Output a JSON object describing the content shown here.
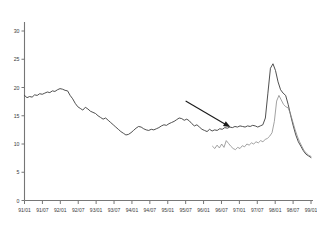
{
  "chart_data": {
    "type": "line",
    "title": "",
    "subtitle": "",
    "xlabel": "",
    "ylabel": "",
    "grid": false,
    "legend": "none",
    "ylim": [
      0,
      30
    ],
    "yticks": [
      0,
      5,
      10,
      15,
      20,
      25,
      30
    ],
    "ytick_labels": [
      "0",
      "5",
      "10",
      "15",
      "20",
      "25",
      "30"
    ],
    "xtick_labels": [
      "91/01",
      "91/07",
      "92/01",
      "92/07",
      "93/01",
      "93/07",
      "94/01",
      "94/07",
      "95/01",
      "95/07",
      "96/01",
      "96/07",
      "97/01",
      "97/07",
      "98/01",
      "98/07",
      "99/01"
    ],
    "xlim_labels": [
      "91/01",
      "99/01"
    ],
    "annotations": [
      {
        "name": "down-right-arrow",
        "type": "arrow",
        "x1_label": "95/07",
        "y1_value": 17.6,
        "x2_label": "96/10",
        "y2_value": 13.0
      }
    ],
    "series": [
      {
        "name": "upper-series",
        "color": "#3c3c3c",
        "width": 0.9,
        "x_start_label": "91/01",
        "values": [
          18.6,
          18.2,
          18.4,
          18.3,
          18.7,
          18.6,
          18.9,
          18.8,
          19.0,
          19.2,
          19.1,
          19.4,
          19.3,
          19.6,
          19.8,
          19.7,
          19.5,
          19.4,
          18.6,
          18.0,
          17.2,
          16.6,
          16.3,
          16.0,
          16.5,
          16.2,
          15.8,
          15.6,
          15.4,
          15.0,
          14.7,
          14.4,
          14.6,
          14.2,
          13.8,
          13.4,
          13.0,
          12.6,
          12.2,
          11.9,
          11.6,
          11.7,
          12.0,
          12.4,
          12.8,
          13.1,
          13.0,
          12.7,
          12.5,
          12.4,
          12.6,
          12.5,
          12.7,
          12.9,
          13.2,
          13.4,
          13.3,
          13.6,
          13.8,
          14.0,
          14.3,
          14.6,
          14.5,
          14.2,
          14.4,
          14.1,
          13.6,
          13.2,
          13.4,
          13.0,
          12.6,
          12.4,
          12.2,
          12.6,
          12.3,
          12.5,
          12.4,
          12.7,
          12.6,
          12.9,
          12.8,
          13.0,
          12.9,
          13.1,
          13.0,
          13.2,
          13.1,
          13.0,
          13.2,
          13.1,
          13.3,
          13.2,
          13.0,
          13.2,
          13.4,
          14.6,
          19.0,
          23.4,
          24.2,
          23.0,
          21.0,
          19.6,
          19.0,
          18.6,
          17.0,
          15.0,
          13.2,
          11.6,
          10.4,
          9.6,
          8.8,
          8.2,
          7.9,
          7.6
        ]
      },
      {
        "name": "lower-series",
        "color": "#8a8a8a",
        "width": 0.8,
        "x_start_label": "96/04",
        "values": [
          9.6,
          9.2,
          9.8,
          9.3,
          10.0,
          9.4,
          10.6,
          10.1,
          9.6,
          9.2,
          9.0,
          9.4,
          9.2,
          9.7,
          9.5,
          10.0,
          9.8,
          10.2,
          10.0,
          10.4,
          10.2,
          10.6,
          10.4,
          10.8,
          11.0,
          11.4,
          12.0,
          14.0,
          17.6,
          18.6,
          17.8,
          17.0,
          16.6,
          16.4,
          15.4,
          14.0,
          12.6,
          11.4,
          10.4,
          9.6,
          8.8,
          8.4,
          8.0,
          7.8
        ]
      }
    ]
  }
}
